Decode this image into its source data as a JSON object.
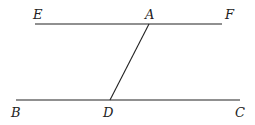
{
  "diagram": {
    "labels": {
      "E": "E",
      "A": "A",
      "F": "F",
      "B": "B",
      "D": "D",
      "C": "C"
    },
    "colors": {
      "stroke": "#222222",
      "background": "#ffffff"
    }
  }
}
